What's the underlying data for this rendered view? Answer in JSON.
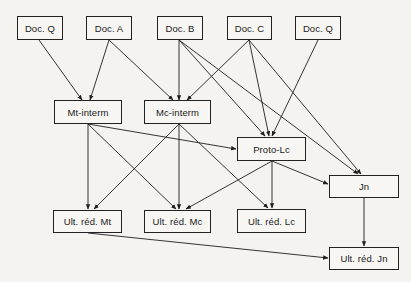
{
  "diagram": {
    "type": "stemma",
    "nodes": [
      {
        "id": "docQ1",
        "label": "Doc. Q",
        "x": 17,
        "y": 16,
        "w": 46,
        "h": 24
      },
      {
        "id": "docA",
        "label": "Doc. A",
        "x": 86,
        "y": 16,
        "w": 46,
        "h": 24
      },
      {
        "id": "docB",
        "label": "Doc. B",
        "x": 157,
        "y": 16,
        "w": 46,
        "h": 24
      },
      {
        "id": "docC",
        "label": "Doc. C",
        "x": 227,
        "y": 16,
        "w": 45,
        "h": 24
      },
      {
        "id": "docQ2",
        "label": "Doc. Q",
        "x": 295,
        "y": 16,
        "w": 46,
        "h": 24
      },
      {
        "id": "mtInterm",
        "label": "Mt-interm",
        "x": 54,
        "y": 100,
        "w": 68,
        "h": 24
      },
      {
        "id": "mcInterm",
        "label": "Mc-interm",
        "x": 144,
        "y": 100,
        "w": 67,
        "h": 24
      },
      {
        "id": "protoLc",
        "label": "Proto-Lc",
        "x": 237,
        "y": 137,
        "w": 69,
        "h": 24
      },
      {
        "id": "jn",
        "label": "Jn",
        "x": 329,
        "y": 175,
        "w": 70,
        "h": 23
      },
      {
        "id": "ultMt",
        "label": "Ult. réd. Mt",
        "x": 53,
        "y": 210,
        "w": 69,
        "h": 23
      },
      {
        "id": "ultMc",
        "label": "Ult. réd. Mc",
        "x": 144,
        "y": 210,
        "w": 67,
        "h": 23
      },
      {
        "id": "ultLc",
        "label": "Ult. réd. Lc",
        "x": 237,
        "y": 209,
        "w": 69,
        "h": 24
      },
      {
        "id": "ultJn",
        "label": "Ult. réd. Jn",
        "x": 329,
        "y": 247,
        "w": 70,
        "h": 23
      }
    ],
    "edges": [
      {
        "from": "docQ1",
        "to": "mtInterm",
        "x1": 39,
        "y1": 40,
        "x2": 82,
        "y2": 100
      },
      {
        "from": "docA",
        "to": "mtInterm",
        "x1": 109,
        "y1": 40,
        "x2": 90,
        "y2": 100
      },
      {
        "from": "docA",
        "to": "mcInterm",
        "x1": 109,
        "y1": 40,
        "x2": 173,
        "y2": 100
      },
      {
        "from": "docB",
        "to": "mcInterm",
        "x1": 179,
        "y1": 40,
        "x2": 179,
        "y2": 100
      },
      {
        "from": "docB",
        "to": "protoLc",
        "x1": 179,
        "y1": 40,
        "x2": 265,
        "y2": 136
      },
      {
        "from": "docB",
        "to": "jn",
        "x1": 179,
        "y1": 40,
        "x2": 358,
        "y2": 174
      },
      {
        "from": "docC",
        "to": "mcInterm",
        "x1": 249,
        "y1": 40,
        "x2": 187,
        "y2": 100
      },
      {
        "from": "docC",
        "to": "protoLc",
        "x1": 249,
        "y1": 40,
        "x2": 269,
        "y2": 136
      },
      {
        "from": "docC",
        "to": "jn",
        "x1": 249,
        "y1": 40,
        "x2": 361,
        "y2": 174
      },
      {
        "from": "docQ2",
        "to": "protoLc",
        "x1": 318,
        "y1": 40,
        "x2": 272,
        "y2": 136
      },
      {
        "from": "mtInterm",
        "to": "protoLc",
        "x1": 88,
        "y1": 124,
        "x2": 236,
        "y2": 149
      },
      {
        "from": "mtInterm",
        "to": "ultMt",
        "x1": 88,
        "y1": 124,
        "x2": 88,
        "y2": 209
      },
      {
        "from": "mtInterm",
        "to": "ultMc",
        "x1": 88,
        "y1": 124,
        "x2": 176,
        "y2": 209
      },
      {
        "from": "mcInterm",
        "to": "ultMt",
        "x1": 179,
        "y1": 124,
        "x2": 94,
        "y2": 209
      },
      {
        "from": "mcInterm",
        "to": "ultMc",
        "x1": 179,
        "y1": 124,
        "x2": 179,
        "y2": 209
      },
      {
        "from": "mcInterm",
        "to": "ultLc",
        "x1": 179,
        "y1": 124,
        "x2": 268,
        "y2": 208
      },
      {
        "from": "protoLc",
        "to": "ultMc",
        "x1": 272,
        "y1": 161,
        "x2": 186,
        "y2": 209
      },
      {
        "from": "protoLc",
        "to": "ultLc",
        "x1": 272,
        "y1": 161,
        "x2": 272,
        "y2": 208
      },
      {
        "from": "protoLc",
        "to": "jn",
        "x1": 272,
        "y1": 161,
        "x2": 328,
        "y2": 184
      },
      {
        "from": "jn",
        "to": "ultJn",
        "x1": 364,
        "y1": 198,
        "x2": 364,
        "y2": 246
      },
      {
        "from": "ultMt",
        "to": "ultJn",
        "x1": 88,
        "y1": 233,
        "x2": 328,
        "y2": 258
      }
    ]
  },
  "colors": {
    "background": "#f4f3f0",
    "line": "#1e1e1e",
    "box_border": "#222222"
  }
}
